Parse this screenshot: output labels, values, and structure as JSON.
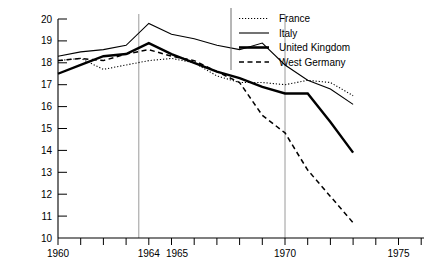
{
  "chart_data": {
    "type": "line",
    "title": "",
    "subtitle": "",
    "xlabel": "",
    "ylabel": "Live births per 1,000 of population",
    "xlim": [
      1960,
      1976
    ],
    "ylim": [
      10,
      20
    ],
    "grid": false,
    "legend_position": "top-right",
    "x_tick_labels": [
      "1960",
      "1964",
      "1965",
      "1970",
      "1975"
    ],
    "x_tick_values": [
      1960,
      1964,
      1965,
      1970,
      1975
    ],
    "x_minor_ticks": [
      1961,
      1962,
      1963,
      1966,
      1967,
      1968,
      1969,
      1971,
      1972,
      1973,
      1974,
      1976
    ],
    "y_tick_labels": [
      "10",
      "11",
      "12",
      "13",
      "14",
      "15",
      "16",
      "17",
      "18",
      "19",
      "20"
    ],
    "y_tick_values": [
      10,
      11,
      12,
      13,
      14,
      15,
      16,
      17,
      18,
      19,
      20
    ],
    "reference_lines": [
      1964,
      1970
    ],
    "x": [
      1960,
      1961,
      1962,
      1963,
      1964,
      1965,
      1966,
      1967,
      1968,
      1969,
      1970,
      1971,
      1972,
      1973
    ],
    "series": [
      {
        "name": "France",
        "style": "dotted",
        "values": [
          18.1,
          18.2,
          17.7,
          17.9,
          18.1,
          18.2,
          18.0,
          17.4,
          17.1,
          17.1,
          17.0,
          17.2,
          17.1,
          16.5
        ]
      },
      {
        "name": "Italy",
        "style": "thin-solid",
        "values": [
          18.3,
          18.5,
          18.6,
          18.8,
          19.8,
          19.3,
          19.1,
          18.8,
          18.6,
          18.9,
          17.9,
          17.2,
          16.8,
          16.1
        ]
      },
      {
        "name": "United Kingdom",
        "style": "thick-solid",
        "values": [
          17.5,
          17.9,
          18.3,
          18.4,
          18.9,
          18.4,
          18.0,
          17.6,
          17.3,
          16.9,
          16.6,
          16.6,
          15.3,
          13.9
        ]
      },
      {
        "name": "West Germany",
        "style": "dashed",
        "values": [
          18.1,
          18.2,
          18.1,
          18.4,
          18.6,
          18.3,
          18.1,
          17.6,
          17.1,
          15.6,
          14.8,
          13.1,
          11.9,
          10.7
        ]
      }
    ]
  },
  "legend": {
    "entries": [
      {
        "label": "France",
        "style": "dotted"
      },
      {
        "label": "Italy",
        "style": "thin-solid"
      },
      {
        "label": "United Kingdom",
        "style": "thick-solid"
      },
      {
        "label": "West Germany",
        "style": "dashed"
      }
    ]
  },
  "colors": {
    "line": "#000000",
    "axis": "#000000",
    "reference_line": "#888888",
    "background": "#ffffff"
  }
}
